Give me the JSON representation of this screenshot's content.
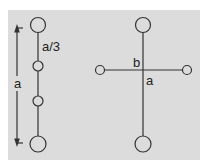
{
  "diagram": {
    "background_color": "#dcdcdc",
    "line_color": "#333333",
    "left_figure": {
      "label_spacing": "a/3",
      "label_length": "a",
      "nodes": [
        "large",
        "small",
        "small",
        "large"
      ]
    },
    "right_figure": {
      "label_horizontal": "b",
      "label_vertical": "a",
      "nodes": [
        "top-large",
        "left-small",
        "right-small",
        "bottom-large"
      ]
    }
  }
}
